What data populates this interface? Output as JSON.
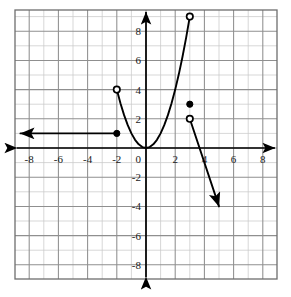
{
  "chart_data": {
    "type": "line",
    "title": "",
    "subtitle": "",
    "xlabel": "",
    "ylabel": "",
    "xlim": [
      -8.8,
      8.8
    ],
    "ylim": [
      -8.8,
      9.4
    ],
    "grid": true,
    "minor_grid": true,
    "grid_step": 1,
    "tick_step": 2,
    "legend": "none",
    "axis_arrows": [
      "left",
      "right",
      "up",
      "down"
    ],
    "xticks": [
      -8,
      -6,
      -4,
      -2,
      0,
      2,
      4,
      6,
      8
    ],
    "xtick_labels": [
      "-8",
      "-6",
      "-4",
      "-2",
      "0",
      "2",
      "4",
      "6",
      "8"
    ],
    "yticks": [
      8,
      6,
      4,
      2,
      -2,
      -4,
      -6,
      -8
    ],
    "ytick_labels": [
      "8",
      "6",
      "4",
      "2",
      "-2",
      "-4",
      "-6",
      "-8"
    ],
    "origin_label": "0",
    "series": [
      {
        "name": "constant-ray",
        "kind": "ray",
        "equation": "y = 1",
        "domain": "x <= -2",
        "points": [
          [
            -2,
            1
          ],
          [
            -8.6,
            1
          ]
        ],
        "arrow_at": "end",
        "endpoint_style": "closed"
      },
      {
        "name": "parabola-branch",
        "kind": "curve",
        "equation": "y = x^2",
        "domain": "-2 < x < 3",
        "points": [
          [
            -2,
            4
          ],
          [
            -1.75,
            3.0625
          ],
          [
            -1.5,
            2.25
          ],
          [
            -1.25,
            1.5625
          ],
          [
            -1,
            1
          ],
          [
            -0.75,
            0.5625
          ],
          [
            -0.5,
            0.25
          ],
          [
            -0.25,
            0.0625
          ],
          [
            0,
            0
          ],
          [
            0.25,
            0.0625
          ],
          [
            0.5,
            0.25
          ],
          [
            0.75,
            0.5625
          ],
          [
            1,
            1
          ],
          [
            1.25,
            1.5625
          ],
          [
            1.5,
            2.25
          ],
          [
            1.75,
            3.0625
          ],
          [
            2,
            4
          ],
          [
            2.25,
            5.0625
          ],
          [
            2.5,
            6.25
          ],
          [
            2.75,
            7.5625
          ],
          [
            3,
            9
          ]
        ],
        "arrow_at": "none",
        "endpoint_style": "open-open"
      },
      {
        "name": "decreasing-ray",
        "kind": "segment",
        "equation": "y = -3x + 11",
        "domain": "3 < x <= 5",
        "points": [
          [
            3,
            2
          ],
          [
            5,
            -4
          ]
        ],
        "arrow_at": "end",
        "endpoint_style": "open"
      }
    ],
    "open_points": [
      {
        "label": "open-point-left-branch",
        "x": -2,
        "y": 4
      },
      {
        "label": "open-point-parabola-top",
        "x": 3,
        "y": 9
      },
      {
        "label": "open-point-ray-start",
        "x": 3,
        "y": 2
      }
    ],
    "closed_points": [
      {
        "label": "closed-point-constant-ray",
        "x": -2,
        "y": 1
      },
      {
        "label": "closed-point-isolated",
        "x": 3,
        "y": 3
      }
    ],
    "colors": {
      "curve": "#000000",
      "axis": "#000000",
      "major_grid": "#8f8f8f",
      "minor_grid": "#c9c9c9",
      "border": "#6e6e6e",
      "label_text": "#1a1a1a",
      "background": "#ffffff"
    }
  },
  "figure": {
    "plot_left": 15,
    "plot_top": 10,
    "plot_right": 277,
    "plot_bottom": 279,
    "origin_px": [
      146,
      148
    ],
    "unit_px": 14.6
  }
}
